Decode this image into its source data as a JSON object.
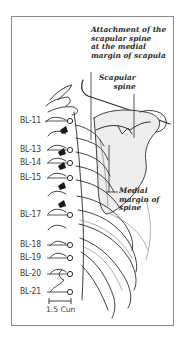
{
  "figure": {
    "annotations": {
      "attachment": [
        "Attachment of the",
        "scapular spine",
        "at the medial",
        "margin of scapula"
      ],
      "scapular_spine": [
        "Scapular",
        "spine"
      ],
      "medial_margin": [
        "Medial",
        "margin of",
        "spine"
      ]
    },
    "points": [
      {
        "label": "BL-11",
        "y": 121
      },
      {
        "label": "BL-13",
        "y": 150
      },
      {
        "label": "BL-14",
        "y": 163
      },
      {
        "label": "BL-15",
        "y": 178
      },
      {
        "label": "BL-17",
        "y": 215
      },
      {
        "label": "BL-18",
        "y": 245
      },
      {
        "label": "BL-19",
        "y": 258
      },
      {
        "label": "BL-20",
        "y": 274
      },
      {
        "label": "BL-21",
        "y": 292
      }
    ],
    "scale_bar": {
      "label": "1.5 Cun"
    },
    "colors": {
      "line": "#2b2b2b",
      "frame": "#8a8a8a",
      "shade": "#d6d6d6",
      "dark": "#1a1a1a"
    }
  }
}
